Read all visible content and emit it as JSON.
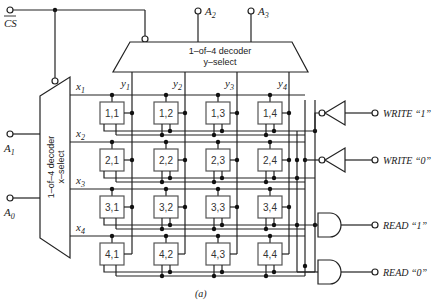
{
  "caption": "(a)",
  "inputs": {
    "cs": "CS",
    "a0": "A",
    "a0_sub": "0",
    "a1": "A",
    "a1_sub": "1",
    "a2": "A",
    "a2_sub": "2",
    "a3": "A",
    "a3_sub": "3"
  },
  "y_decoder": {
    "line1": "1–of–4  decoder",
    "line2": "y–select"
  },
  "x_decoder": {
    "line1": "1–of–4  decoder",
    "line2": "x–select"
  },
  "y_lines": [
    {
      "name": "y",
      "sub": "1"
    },
    {
      "name": "y",
      "sub": "2"
    },
    {
      "name": "y",
      "sub": "3"
    },
    {
      "name": "y",
      "sub": "4"
    }
  ],
  "x_lines": [
    {
      "name": "x",
      "sub": "1"
    },
    {
      "name": "x",
      "sub": "2"
    },
    {
      "name": "x",
      "sub": "3"
    },
    {
      "name": "x",
      "sub": "4"
    }
  ],
  "cells": [
    [
      "1,1",
      "1,2",
      "1,3",
      "1,4"
    ],
    [
      "2,1",
      "2,2",
      "2,3",
      "2,4"
    ],
    [
      "3,1",
      "3,2",
      "3,3",
      "3,4"
    ],
    [
      "4,1",
      "4,2",
      "4,3",
      "4,4"
    ]
  ],
  "outputs": {
    "write1": "WRITE “1”",
    "write0": "WRITE “0”",
    "read1": "READ “1”",
    "read0": "READ “0”"
  }
}
